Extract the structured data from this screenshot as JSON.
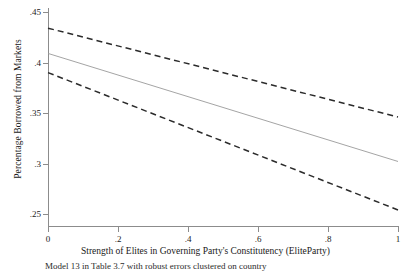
{
  "chart_data": {
    "type": "line",
    "title": "",
    "xlabel": "Strength of Elites in Governing Party's Constitutency (EliteParty)",
    "ylabel": "Percentage Borrowed from Markets",
    "xlim": [
      0,
      1
    ],
    "ylim": [
      0.25,
      0.45
    ],
    "xticks": [
      "0",
      ".2",
      ".4",
      ".6",
      ".8",
      "1"
    ],
    "xtick_values": [
      0,
      0.2,
      0.4,
      0.6,
      0.8,
      1
    ],
    "yticks": [
      ".25",
      ".3",
      ".35",
      ".4",
      ".45"
    ],
    "ytick_values": [
      0.25,
      0.3,
      0.35,
      0.4,
      0.45
    ],
    "grid": false,
    "legend": "none",
    "x": [
      0,
      1
    ],
    "series": [
      {
        "name": "Upper 95% confidence bound",
        "style": "dashed",
        "color": "#2b2b2b",
        "values": [
          0.434,
          0.346
        ]
      },
      {
        "name": "Predicted percentage borrowed from markets",
        "style": "solid",
        "color": "#9a9a9a",
        "values": [
          0.409,
          0.302
        ]
      },
      {
        "name": "Lower 95% confidence bound",
        "style": "dashed",
        "color": "#2b2b2b",
        "values": [
          0.39,
          0.254
        ]
      }
    ],
    "caption": "Model 13 in Table 3.7 with robust errors clustered on country"
  },
  "colors": {
    "axis": "#8c8c8c",
    "bound_line": "#2b2b2b",
    "fit_line": "#9a9a9a",
    "text": "#1a1a1a",
    "background": "#ffffff"
  }
}
